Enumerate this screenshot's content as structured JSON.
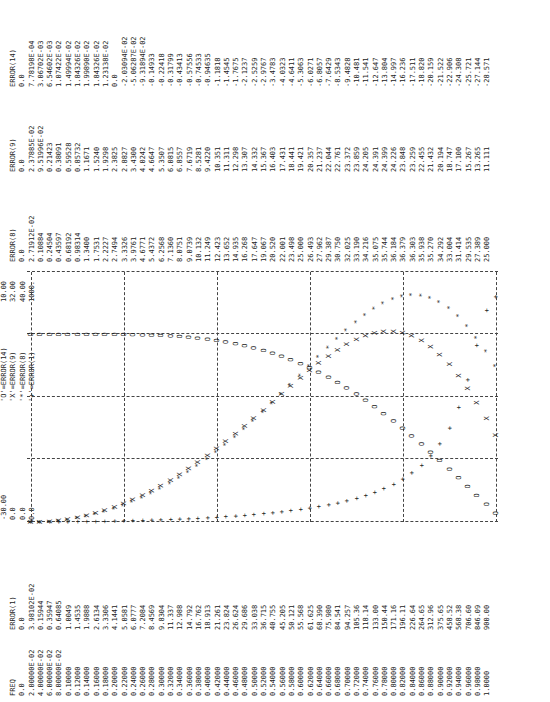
{
  "headers": {
    "freq": "FREQ",
    "e1": "ERROR(1)",
    "e8": "ERROR(8)",
    "e9": "ERROR(9)",
    "e14": "ERROR(14)"
  },
  "scales": {
    "mins": [
      "-30.00",
      "0.0",
      "0.0",
      "0.0"
    ],
    "maxs": [
      "10.00",
      "32.00",
      "40.00",
      "1000."
    ]
  },
  "legend": [
    "'O'=ERROR(14)",
    "'X'=ERROR(9)",
    "'*'=ERROR(8)",
    "'+'=ERROR(1)"
  ],
  "chart_data": {
    "type": "scatter",
    "xlabel": "FREQ",
    "x": [
      0.0,
      0.02,
      0.04,
      0.06,
      0.08,
      0.1,
      0.12,
      0.14,
      0.16,
      0.18,
      0.2,
      0.22,
      0.24,
      0.26,
      0.28,
      0.3,
      0.32,
      0.34,
      0.36,
      0.38,
      0.4,
      0.42,
      0.44,
      0.46,
      0.48,
      0.5,
      0.52,
      0.54,
      0.56,
      0.58,
      0.6,
      0.62,
      0.64,
      0.66,
      0.68,
      0.7,
      0.72,
      0.74,
      0.76,
      0.78,
      0.8,
      0.82,
      0.84,
      0.86,
      0.88,
      0.9,
      0.92,
      0.94,
      0.96,
      0.98,
      1.0
    ],
    "series": [
      {
        "name": "ERROR(14)",
        "symbol": "O",
        "range": [
          -30,
          10
        ],
        "values": [
          0.0,
          0.000778198,
          0.00306702,
          0.00654602,
          0.0107422,
          0.0149994,
          0.0184326,
          0.019989,
          0.0184326,
          0.0123138,
          0.0,
          -0.0203094,
          -0.0506287,
          -0.0931894,
          -0.14933,
          -0.22418,
          -0.31799,
          -0.43413,
          -0.57556,
          -0.74533,
          -0.94635,
          -1.1818,
          -1.4545,
          -1.7675,
          -2.1237,
          -2.5259,
          -2.9767,
          -3.4783,
          -4.0323,
          -4.6411,
          -5.3063,
          -6.0271,
          -6.8057,
          -7.6429,
          -8.5343,
          -9.4828,
          -10.481,
          -11.541,
          -12.647,
          -13.804,
          -14.997,
          -16.236,
          -17.511,
          -18.82,
          -20.159,
          -21.522,
          -22.906,
          -24.308,
          -25.721,
          -27.144,
          -28.571
        ]
      },
      {
        "name": "ERROR(9)",
        "symbol": "X",
        "range": [
          0,
          32
        ],
        "values": [
          0.0,
          0.0237885,
          0.0951996,
          0.21423,
          0.38091,
          0.59528,
          0.85732,
          1.1671,
          1.524,
          1.9298,
          2.3825,
          2.8827,
          3.43,
          4.0242,
          4.6647,
          5.3507,
          6.0815,
          6.8557,
          7.6719,
          8.5281,
          9.422,
          10.351,
          11.311,
          12.298,
          13.307,
          14.332,
          15.367,
          16.403,
          17.431,
          18.441,
          19.421,
          20.357,
          21.237,
          22.044,
          22.761,
          23.372,
          23.859,
          24.205,
          24.391,
          24.399,
          24.226,
          23.848,
          23.259,
          22.455,
          21.432,
          20.194,
          18.747,
          17.1,
          15.267,
          13.265,
          11.111
        ]
      },
      {
        "name": "ERROR(8)",
        "symbol": "*",
        "range": [
          0,
          40
        ],
        "values": [
          0.0,
          0.0271912,
          0.10884,
          0.24504,
          0.43597,
          0.68192,
          0.98314,
          1.34,
          1.7531,
          2.2227,
          2.7494,
          3.3326,
          3.9761,
          4.6771,
          5.4372,
          6.2568,
          7.136,
          8.0751,
          9.0739,
          10.132,
          11.249,
          12.423,
          13.652,
          14.935,
          16.268,
          17.647,
          19.067,
          20.52,
          22.001,
          23.498,
          25.0,
          26.493,
          27.962,
          29.387,
          30.75,
          32.025,
          33.19,
          34.216,
          35.075,
          35.744,
          36.184,
          36.379,
          36.303,
          35.938,
          35.27,
          34.292,
          33.004,
          31.414,
          29.535,
          27.389,
          25.0
        ]
      },
      {
        "name": "ERROR(1)",
        "symbol": "+",
        "range": [
          0,
          1000
        ],
        "values": [
          0.0,
          0.0398102,
          0.15944,
          0.35947,
          0.64085,
          1.0049,
          1.4535,
          1.9888,
          2.6134,
          3.3306,
          4.1441,
          5.0581,
          6.0777,
          7.2084,
          8.4569,
          9.8304,
          11.337,
          12.988,
          14.792,
          16.762,
          18.913,
          21.261,
          23.824,
          26.624,
          29.686,
          33.038,
          36.715,
          40.755,
          45.205,
          50.121,
          55.568,
          61.625,
          68.39,
          75.98,
          84.541,
          94.257,
          105.36,
          118.14,
          133.0,
          150.44,
          171.16,
          196.11,
          226.64,
          264.65,
          312.96,
          375.65,
          458.52,
          568.38,
          706.6,
          846.09,
          900.0
        ]
      }
    ]
  },
  "rows": {
    "freq": [
      "0.0",
      "2.00000E-02",
      "4.00000E-02",
      "6.00000E-02",
      "8.00000E-02",
      "0.10000",
      "0.12000",
      "0.14000",
      "0.16000",
      "0.18000",
      "0.20000",
      "0.22000",
      "0.24000",
      "0.26000",
      "0.28000",
      "0.30000",
      "0.32000",
      "0.34000",
      "0.36000",
      "0.38000",
      "0.40000",
      "0.42000",
      "0.44000",
      "0.46000",
      "0.48000",
      "0.50000",
      "0.52000",
      "0.54000",
      "0.56000",
      "0.58000",
      "0.60000",
      "0.62000",
      "0.64000",
      "0.66000",
      "0.68000",
      "0.70000",
      "0.72000",
      "0.74000",
      "0.76000",
      "0.78000",
      "0.80000",
      "0.82000",
      "0.84000",
      "0.86000",
      "0.88000",
      "0.90000",
      "0.92000",
      "0.94000",
      "0.96000",
      "0.98000",
      "1.0000"
    ],
    "e1": [
      "0.0",
      "3.98102E-02",
      "0.15944",
      "0.35947",
      "0.64085",
      "1.0049",
      "1.4535",
      "1.9888",
      "2.6134",
      "3.3306",
      "4.1441",
      "5.0581",
      "6.0777",
      "7.2084",
      "8.4569",
      "9.8304",
      "11.337",
      "12.988",
      "14.792",
      "16.762",
      "18.913",
      "21.261",
      "23.824",
      "26.624",
      "29.686",
      "33.038",
      "36.715",
      "40.755",
      "45.205",
      "50.121",
      "55.568",
      "61.625",
      "68.390",
      "75.980",
      "84.541",
      "94.257",
      "105.36",
      "118.14",
      "133.00",
      "150.44",
      "171.16",
      "196.11",
      "226.64",
      "264.65",
      "312.96",
      "375.65",
      "458.52",
      "568.38",
      "706.60",
      "846.09",
      "900.00"
    ],
    "e8": [
      "0.0",
      "2.71912E-02",
      "0.10884",
      "0.24504",
      "0.43597",
      "0.68192",
      "0.98314",
      "1.3400",
      "1.7531",
      "2.2227",
      "2.7494",
      "3.3326",
      "3.9761",
      "4.6771",
      "5.4372",
      "6.2568",
      "7.1360",
      "8.0751",
      "9.0739",
      "10.132",
      "11.249",
      "12.423",
      "13.652",
      "14.935",
      "16.268",
      "17.647",
      "19.067",
      "20.520",
      "22.001",
      "23.498",
      "25.000",
      "26.493",
      "27.962",
      "29.387",
      "30.750",
      "32.025",
      "33.190",
      "34.216",
      "35.075",
      "35.744",
      "36.184",
      "36.379",
      "36.303",
      "35.938",
      "35.270",
      "34.292",
      "33.004",
      "31.414",
      "29.535",
      "27.389",
      "25.000"
    ],
    "e9": [
      "0.0",
      "2.37885E-02",
      "9.51996E-02",
      "0.21423",
      "0.38091",
      "0.59528",
      "0.85732",
      "1.1671",
      "1.5240",
      "1.9298",
      "2.3825",
      "2.8827",
      "3.4300",
      "4.0242",
      "4.6647",
      "5.3507",
      "6.0815",
      "6.8557",
      "7.6719",
      "8.5281",
      "9.4220",
      "10.351",
      "11.311",
      "12.298",
      "13.307",
      "14.332",
      "15.367",
      "16.403",
      "17.431",
      "18.441",
      "19.421",
      "20.357",
      "21.237",
      "22.044",
      "22.761",
      "23.372",
      "23.859",
      "24.205",
      "24.391",
      "24.399",
      "24.226",
      "23.848",
      "23.259",
      "22.455",
      "21.432",
      "20.194",
      "18.747",
      "17.100",
      "15.267",
      "13.265",
      "11.111"
    ],
    "e14": [
      "0.0",
      "7.78198E-04",
      "3.06702E-03",
      "6.54602E-03",
      "1.07422E-02",
      "1.49994E-02",
      "1.84326E-02",
      "1.99890E-02",
      "1.84326E-02",
      "1.23138E-02",
      "0.0",
      "-2.03094E-02",
      "-5.06287E-02",
      "-9.31894E-02",
      "-0.14933",
      "-0.22418",
      "-0.31799",
      "-0.43413",
      "-0.57556",
      "-0.74533",
      "-0.94635",
      "-1.1818",
      "-1.4545",
      "-1.7675",
      "-2.1237",
      "-2.5259",
      "-2.9767",
      "-3.4783",
      "-4.0323",
      "-4.6411",
      "-5.3063",
      "-6.0271",
      "-6.8057",
      "-7.6429",
      "-8.5343",
      "-9.4828",
      "-10.481",
      "-11.541",
      "-12.647",
      "-13.804",
      "-14.997",
      "-16.236",
      "-17.511",
      "-18.820",
      "-20.159",
      "-21.522",
      "-22.906",
      "-24.308",
      "-25.721",
      "-27.144",
      "-28.571"
    ]
  }
}
